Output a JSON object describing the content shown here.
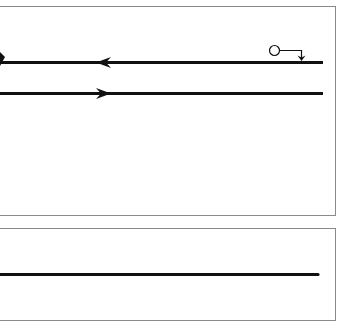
{
  "diagram": {
    "type": "signal-flow",
    "colors": {
      "line": "#111111",
      "panel_border": "#8a8a8a",
      "background": "#ffffff"
    },
    "top_panel": {
      "lines": [
        {
          "id": "upper-line",
          "direction": "left",
          "y": 62,
          "x_start": 0,
          "x_end": 323
        },
        {
          "id": "lower-line",
          "direction": "right",
          "y": 93,
          "x_start": 0,
          "x_end": 323
        }
      ],
      "source": {
        "shape": "circle",
        "connector": "down-arrow-onto-upper-line"
      },
      "left_edge_marker": "down-arrowhead"
    },
    "bottom_panel": {
      "lines": [
        {
          "id": "single-line",
          "direction": "none",
          "y": 274,
          "x_start": 0,
          "x_end": 318
        }
      ]
    }
  }
}
